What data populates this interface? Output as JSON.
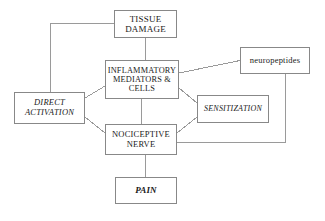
{
  "diagram": {
    "type": "flowchart",
    "background_color": "#ffffff",
    "border_color": "#888888",
    "connector_color": "#9a9a9a",
    "text_color": "#1a1a1a",
    "nodes": [
      {
        "id": "tissue_damage",
        "label": "TISSUE\nDAMAGE",
        "style": "upper-case"
      },
      {
        "id": "inflammatory",
        "label": "INFLAMMATORY\nMEDIATORS &\nCELLS",
        "style": "upper-case"
      },
      {
        "id": "neuropeptides",
        "label": "neuropeptides",
        "style": "lower-case"
      },
      {
        "id": "direct_activation",
        "label": "DIRECT\nACTIVATION",
        "style": "italic"
      },
      {
        "id": "sensitization",
        "label": "SENSITIZATION",
        "style": "italic"
      },
      {
        "id": "nociceptive_nerve",
        "label": "NOCICEPTIVE\nNERVE",
        "style": "upper-case"
      },
      {
        "id": "pain",
        "label": "PAIN",
        "style": "italic-bold"
      }
    ],
    "edges": [
      {
        "from": "tissue_damage",
        "to": "inflammatory"
      },
      {
        "from": "tissue_damage",
        "to": "direct_activation"
      },
      {
        "from": "inflammatory",
        "to": "neuropeptides"
      },
      {
        "from": "inflammatory",
        "to": "direct_activation"
      },
      {
        "from": "inflammatory",
        "to": "sensitization"
      },
      {
        "from": "inflammatory",
        "to": "nociceptive_nerve"
      },
      {
        "from": "direct_activation",
        "to": "nociceptive_nerve"
      },
      {
        "from": "sensitization",
        "to": "nociceptive_nerve"
      },
      {
        "from": "neuropeptides",
        "to": "nociceptive_nerve"
      },
      {
        "from": "nociceptive_nerve",
        "to": "pain"
      }
    ]
  }
}
